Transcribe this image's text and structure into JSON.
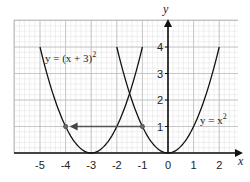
{
  "chart_data": {
    "type": "line",
    "title": "",
    "xlabel": "x",
    "ylabel": "y",
    "xlim": [
      -5.5,
      2.5
    ],
    "ylim": [
      0,
      5
    ],
    "grid": true,
    "x_ticks": [
      "-5",
      "-4",
      "-3",
      "-2",
      "-1",
      "0",
      "1",
      "2"
    ],
    "y_ticks": [
      "1",
      "2",
      "3",
      "4"
    ],
    "series": [
      {
        "name": "y = (x + 3)^2",
        "x": [
          -5,
          -4,
          -3,
          -2,
          -1
        ],
        "y": [
          4,
          1,
          0,
          1,
          4
        ]
      },
      {
        "name": "y = x^2",
        "x": [
          -2,
          -1,
          0,
          1,
          2
        ],
        "y": [
          4,
          1,
          0,
          1,
          4
        ]
      }
    ],
    "annotations": [
      {
        "type": "arrow",
        "from": [
          -1,
          1
        ],
        "to": [
          -4,
          1
        ]
      },
      {
        "type": "point",
        "at": [
          -1,
          1
        ]
      },
      {
        "type": "point",
        "at": [
          -4,
          1
        ]
      }
    ],
    "legend": "inline labels"
  },
  "labels": {
    "curve1": "y = (x + 3)",
    "curve1_exp": "2",
    "curve2": "y = x",
    "curve2_exp": "2",
    "x_axis": "x",
    "y_axis": "y"
  }
}
